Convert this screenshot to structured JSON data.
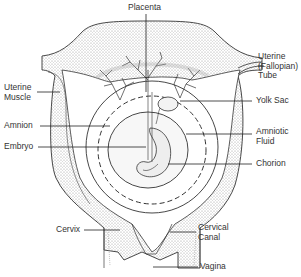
{
  "diagram": {
    "colors": {
      "line": "#333333",
      "stipple": "#bdbdbd",
      "background": "#ffffff"
    },
    "labels": {
      "placenta": "Placenta",
      "uterine_tube": [
        "Uterine",
        "(Fallopian)",
        "Tube"
      ],
      "uterine_muscle": [
        "Uterine",
        "Muscle"
      ],
      "yolk_sac": "Yolk Sac",
      "amnion": "Amnion",
      "amniotic_fluid": [
        "Amniotic",
        "Fluid"
      ],
      "embryo": "Embryo",
      "chorion": "Chorion",
      "cervix": "Cervix",
      "cervical_canal": [
        "Cervical",
        "Canal"
      ],
      "vagina": "Vagina"
    }
  }
}
